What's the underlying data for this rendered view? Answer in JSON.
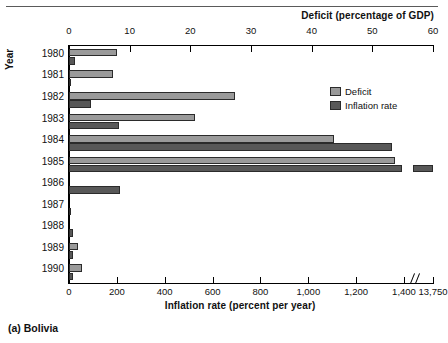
{
  "caption": "(a) Bolivia",
  "axes": {
    "y_title": "Year",
    "top_title": "Deficit (percentage of GDP)",
    "bottom_title": "Inflation rate (percent per year)"
  },
  "legend": {
    "items": [
      {
        "label": "Deficit",
        "color": "#9a9a9a"
      },
      {
        "label": "Inflation rate",
        "color": "#585858"
      }
    ]
  },
  "chart_data": {
    "type": "bar",
    "orientation": "horizontal",
    "title": "(a) Bolivia",
    "categories": [
      "1980",
      "1981",
      "1982",
      "1983",
      "1984",
      "1985",
      "1986",
      "1987",
      "1988",
      "1989",
      "1990"
    ],
    "ylabel": "Year",
    "grid": false,
    "legend_position": "inside-upper-right",
    "axis_break": {
      "axis": "bottom",
      "after": 1400,
      "to": 13750
    },
    "series": [
      {
        "name": "Deficit",
        "unit": "percentage of GDP",
        "axis": "top",
        "axis_label": "Deficit (percentage of GDP)",
        "xlim": [
          0,
          60
        ],
        "xticks": [
          0,
          10,
          20,
          30,
          40,
          50,
          60
        ],
        "xticklabels": [
          "0",
          "10",
          "20",
          "30",
          "40",
          "50",
          "60"
        ],
        "color": "#9a9a9a",
        "values": [
          7.9,
          7.2,
          27.4,
          20.7,
          43.6,
          53.7,
          0,
          0,
          0,
          1.5,
          2.2
        ]
      },
      {
        "name": "Inflation rate",
        "unit": "percent per year",
        "axis": "bottom",
        "axis_label": "Inflation rate (percent per year)",
        "xlim": [
          0,
          1400
        ],
        "xticks": [
          0,
          200,
          400,
          600,
          800,
          1000,
          1200,
          1400,
          13750
        ],
        "xticklabels": [
          "0",
          "200",
          "400",
          "600",
          "800",
          "1,000",
          "1,200",
          "1,400",
          "13,750"
        ],
        "color": "#585858",
        "values": [
          24,
          10,
          90,
          210,
          1350,
          13750,
          215,
          10,
          17,
          15,
          18
        ]
      }
    ]
  }
}
